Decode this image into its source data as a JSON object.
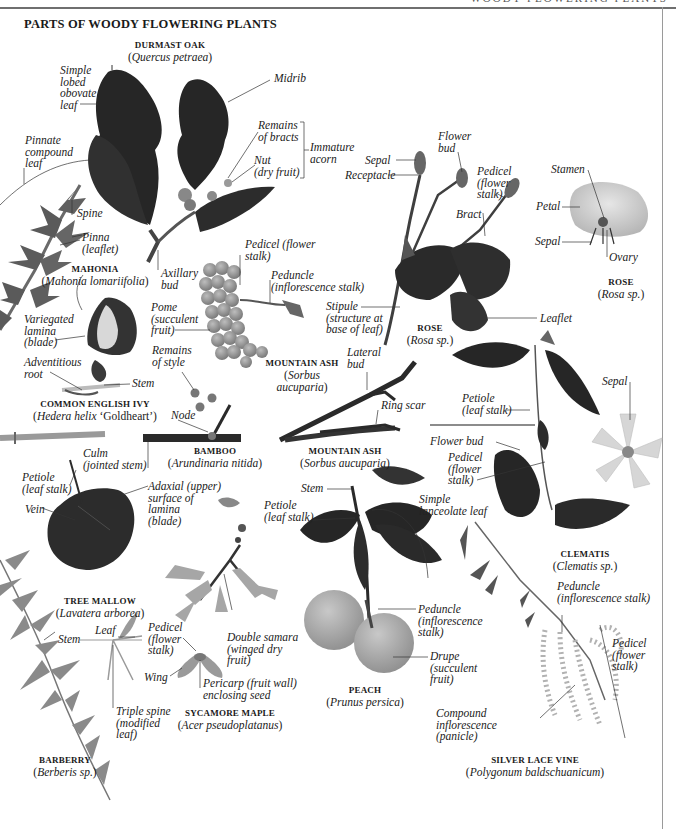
{
  "header": {
    "running_head": "WOODY FLOWERING PLANTS",
    "title": "PARTS OF WOODY FLOWERING PLANTS"
  },
  "palette": {
    "dark_leaf": "#2a2a2a",
    "mid_leaf": "#6b6b6b",
    "light_leaf": "#a8a8a8",
    "fruit": "#8c8c8c",
    "rule": "#6f6f6f",
    "text": "#222222"
  },
  "specimens": {
    "oak": {
      "common": "DURMAST OAK",
      "pre": "(",
      "scientific": "Quercus petraea",
      "post": ")",
      "labels": {
        "simple_leaf": "Simple\nlobed\nobovate\nleaf",
        "midrib": "Midrib",
        "bracts": "Remains\nof bracts",
        "nut": "Nut\n(dry fruit)",
        "acorn": "Immature\nacorn",
        "axillary": "Axillary\nbud"
      }
    },
    "mahonia": {
      "common": "MAHONIA",
      "pre": "(",
      "scientific": "Mahonia lomariifolia",
      "post": ")",
      "labels": {
        "pinnate": "Pinnate\ncompound\nleaf",
        "spine": "Spine",
        "pinna": "Pinna\n(leaflet)"
      }
    },
    "ivy": {
      "common": "COMMON ENGLISH IVY",
      "pre": "(",
      "scientific": "Hedera helix",
      "post": " ‘Goldheart’)",
      "labels": {
        "variegated": "Variegated\nlamina\n(blade)",
        "adventitious": "Adventitious\nroot",
        "stem": "Stem"
      }
    },
    "mountain_ash_fruit": {
      "common": "MOUNTAIN ASH",
      "pre": "(",
      "scientific": "Sorbus\naucuparia",
      "post": ")",
      "labels": {
        "pedicel": "Pedicel (flower\nstalk)",
        "peduncle": "Peduncle\n(inflorescence stalk)",
        "pome": "Pome\n(succulent\nfruit)",
        "style": "Remains\nof style"
      }
    },
    "rose_stem": {
      "common": "ROSE",
      "pre": "(",
      "scientific": "Rosa sp.",
      "post": ")",
      "labels": {
        "sepal": "Sepal",
        "receptacle": "Receptacle",
        "flower_bud": "Flower\nbud",
        "pedicel": "Pedicel\n(flower\nstalk)",
        "bract": "Bract",
        "stipule": "Stipule\n(structure at\nbase of leaf)",
        "leaflet": "Leaflet"
      }
    },
    "rose_flower": {
      "common": "ROSE",
      "pre": "(",
      "scientific": "Rosa sp.",
      "post": ")",
      "labels": {
        "stamen": "Stamen",
        "petal": "Petal",
        "sepal": "Sepal",
        "ovary": "Ovary"
      }
    },
    "bamboo": {
      "common": "BAMBOO",
      "pre": "(",
      "scientific": "Arundinaria nitida",
      "post": ")",
      "labels": {
        "node": "Node",
        "culm": "Culm\n(jointed stem)"
      }
    },
    "mountain_ash_twig": {
      "common": "MOUNTAIN ASH",
      "pre": "(",
      "scientific": "Sorbus aucuparia",
      "post": ")",
      "labels": {
        "lateral_bud": "Lateral\nbud",
        "ring_scar": "Ring scar"
      }
    },
    "clematis": {
      "common": "CLEMATIS",
      "pre": "(",
      "scientific": "Clematis sp.",
      "post": ")",
      "labels": {
        "petiole": "Petiole\n(leaf stalk)",
        "sepal": "Sepal",
        "flower_bud": "Flower bud",
        "pedicel": "Pedicel\n(flower\nstalk)"
      }
    },
    "tree_mallow": {
      "common": "TREE MALLOW",
      "pre": "(",
      "scientific": "Lavatera arborea",
      "post": ")",
      "labels": {
        "petiole": "Petiole\n(leaf stalk)",
        "vein": "Vein",
        "adaxial": "Adaxial (upper)\nsurface of\nlamina\n(blade)"
      }
    },
    "sycamore": {
      "common": "SYCAMORE MAPLE",
      "pre": "(",
      "scientific": "Acer pseudoplatanus",
      "post": ")",
      "labels": {
        "pedicel": "Pedicel\n(flower\nstalk)",
        "double_samara": "Double samara\n(winged dry\nfruit)",
        "wing": "Wing",
        "pericarp": "Pericarp (fruit wall)\nenclosing seed"
      }
    },
    "peach": {
      "common": "PEACH",
      "pre": "(",
      "scientific": "Prunus persica",
      "post": ")",
      "labels": {
        "stem": "Stem",
        "petiole": "Petiole\n(leaf stalk)",
        "lanceolate": "Simple\nlanceolate leaf",
        "peduncle": "Peduncle\n(inflorescence\nstalk)",
        "drupe": "Drupe\n(succulent\nfruit)"
      }
    },
    "barberry": {
      "common": "BARBERRY",
      "pre": "(",
      "scientific": "Berberis sp.",
      "post": ")",
      "labels": {
        "stem": "Stem",
        "leaf": "Leaf",
        "triple_spine": "Triple spine\n(modified\nleaf)"
      }
    },
    "silver_lace": {
      "common": "SILVER LACE VINE",
      "pre": "(",
      "scientific": "Polygonum baldschuanicum",
      "post": ")",
      "labels": {
        "peduncle": "Peduncle\n(inflorescence stalk)",
        "pedicel": "Pedicel\n(flower\nstalk)",
        "compound": "Compound\ninflorescence\n(panicle)"
      }
    }
  }
}
